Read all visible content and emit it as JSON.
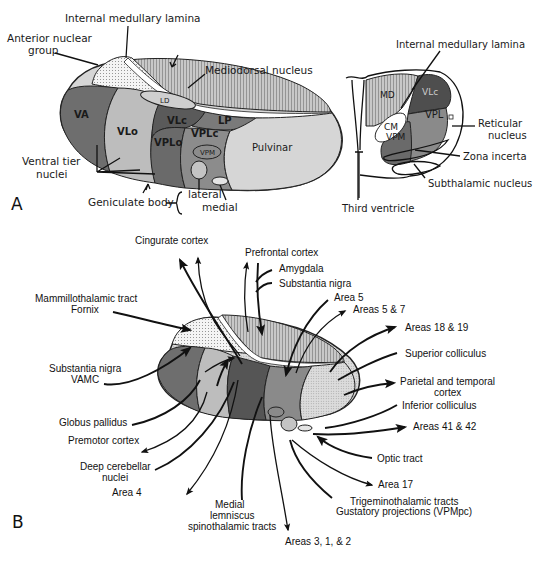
{
  "panel_a": {
    "panel_letter": "A",
    "labels": {
      "internal_medullary_lamina": "Internal medullary lamina",
      "anterior_nuclear_group_1": "Anterior nuclear",
      "anterior_nuclear_group_2": "group",
      "mediodorsal_nucleus": "Mediodorsal nucleus",
      "ventral_tier_nuclei_1": "Ventral tier",
      "ventral_tier_nuclei_2": "nuclei",
      "geniculate_body": "Geniculate body",
      "lateral": "lateral",
      "medial": "medial"
    },
    "nuclei": {
      "va": "VA",
      "vlo": "VLo",
      "vlc": "VLc",
      "ld": "LD",
      "lp": "LP",
      "vplo": "VPLo",
      "vplc": "VPLc",
      "vpm": "VPM",
      "pulvinar": "Pulvinar"
    },
    "cross_section": {
      "labels": {
        "internal_medullary_lamina": "Internal medullary lamina",
        "reticular_nucleus_1": "Reticular",
        "reticular_nucleus_2": "nucleus",
        "zona_incerta": "Zona incerta",
        "subthalamic_nucleus": "Subthalamic nucleus",
        "third_ventricle": "Third ventricle"
      },
      "nuclei": {
        "md": "MD",
        "vlc": "VLc",
        "cm": "CM",
        "vpl": "VPL",
        "vpm": "VPM"
      }
    }
  },
  "panel_b": {
    "panel_letter": "B",
    "connections": {
      "cingurate_cortex": "Cingurate cortex",
      "prefrontal_cortex": "Prefrontal cortex",
      "amygdala": "Amygdala",
      "substantia_nigra": "Substantia nigra",
      "area_5": "Area 5",
      "areas_5_7": "Areas 5 & 7",
      "areas_18_19": "Areas 18 & 19",
      "superior_colliculus": "Superior colliculus",
      "parietal_temporal_1": "Parietal and temporal",
      "parietal_temporal_2": "cortex",
      "inferior_colliculus": "Inferior colliculus",
      "areas_41_42": "Areas 41 & 42",
      "optic_tract": "Optic tract",
      "area_17": "Area 17",
      "trigeminothalamic": "Trigeminothalamic tracts",
      "gustatory": "Gustatory projections (VPMpc)",
      "areas_3_1_2": "Areas 3, 1, & 2",
      "medial_lemniscus_1": "Medial",
      "medial_lemniscus_2": "lemniscus",
      "medial_lemniscus_3": "spinothalamic tracts",
      "area_4": "Area 4",
      "deep_cerebellar_1": "Deep cerebellar",
      "deep_cerebellar_2": "nuclei",
      "premotor_cortex": "Premotor cortex",
      "globus_pallidus": "Globus pallidus",
      "substantia_nigra_vamc_1": "Substantia nigra",
      "substantia_nigra_vamc_2": "VAMC",
      "mammillothalamic_1": "Mammillothalamic tract",
      "mammillothalamic_2": "Fornix"
    }
  },
  "colors": {
    "va": "#6e6e6e",
    "vlo": "#bdbdbd",
    "vlc": "#5a5a5a",
    "vplc": "#8c8c8c",
    "pulvinar": "#d6d6d6",
    "md": "#b5b5b5",
    "anterior": "#ececec"
  }
}
